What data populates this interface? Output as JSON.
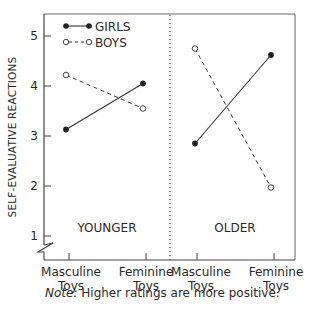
{
  "chart_data": {
    "type": "line",
    "title": "",
    "ylabel": "SELF-EVALUATIVE REACTIONS",
    "xlabel": "",
    "ylim": [
      1,
      5
    ],
    "yticks": [
      "1",
      "2",
      "3",
      "4",
      "5"
    ],
    "grid": false,
    "legend_position": "top-left inside",
    "axis_break": true,
    "panels": [
      {
        "label": "YOUNGER",
        "categories": [
          "Masculine Toys",
          "Feminine Toys"
        ],
        "series": [
          {
            "name": "GIRLS",
            "style": "solid",
            "marker": "filled-circle",
            "values": [
              3.13,
              4.05
            ]
          },
          {
            "name": "BOYS",
            "style": "dashed",
            "marker": "open-circle",
            "values": [
              4.22,
              3.55
            ]
          }
        ]
      },
      {
        "label": "OLDER",
        "categories": [
          "Masculine Toys",
          "Feminine Toys"
        ],
        "series": [
          {
            "name": "GIRLS",
            "style": "solid",
            "marker": "filled-circle",
            "values": [
              2.85,
              4.62
            ]
          },
          {
            "name": "BOYS",
            "style": "dashed",
            "marker": "open-circle",
            "values": [
              4.75,
              1.97
            ]
          }
        ]
      }
    ],
    "legend": [
      "GIRLS",
      "BOYS"
    ],
    "annotations": [
      "Note: Higher ratings are more positive."
    ]
  },
  "labels": {
    "y_axis_title": "SELF-EVALUATIVE REACTIONS",
    "y_ticks": [
      "1",
      "2",
      "3",
      "4",
      "5"
    ],
    "legend_girls": "GIRLS",
    "legend_boys": "BOYS",
    "panel_younger": "YOUNGER",
    "panel_older": "OLDER",
    "x_cat_1_line1": "Masculine",
    "x_cat_1_line2": "Toys",
    "x_cat_2_line1": "Feminine",
    "x_cat_2_line2": "Toys",
    "x_cat_3_line1": "Masculine",
    "x_cat_3_line2": "Toys",
    "x_cat_4_line1": "Feminine",
    "x_cat_4_line2": "Toys",
    "note_prefix": "Note:",
    "note_text": " Higher ratings are more positive."
  },
  "colors": {
    "axis": "#555555",
    "line": "#333333",
    "text": "#2a2a2a"
  }
}
